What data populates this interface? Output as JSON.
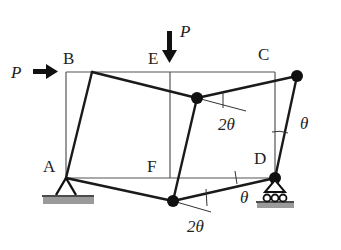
{
  "diagram": {
    "labels": {
      "A": "A",
      "B": "B",
      "C": "C",
      "D": "D",
      "E": "E",
      "F": "F",
      "load_horizontal": "P",
      "load_vertical": "P",
      "angle_E": "2θ",
      "angle_C": "θ",
      "angle_D": "θ",
      "angle_F": "2θ"
    },
    "colors": {
      "line": "#1a1a1a",
      "thin_line": "#555555",
      "ground": "#9a9a9a"
    },
    "supports": {
      "A": "pin",
      "D": "roller"
    }
  }
}
